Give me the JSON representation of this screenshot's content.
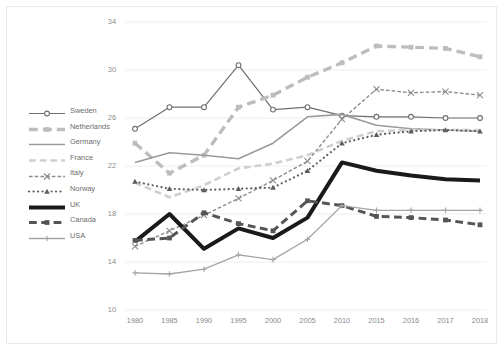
{
  "chart": {
    "type": "line",
    "title": "",
    "xlabel": "",
    "ylabel": "",
    "grid": true,
    "legend_position": "left-inside",
    "ylim": [
      10,
      34
    ],
    "ytick_step": 4,
    "yticks": [
      "10",
      "14",
      "18",
      "22",
      "26",
      "30",
      "34"
    ],
    "categories": [
      "1980",
      "1985",
      "1990",
      "1995",
      "2000",
      "2005",
      "2010",
      "2015",
      "2016",
      "2017",
      "2018"
    ]
  },
  "chart_data": {
    "type": "line",
    "title": "",
    "xlabel": "",
    "ylabel": "",
    "grid": true,
    "ylim": [
      10,
      34
    ],
    "yticks": [
      10,
      14,
      18,
      22,
      26,
      30,
      34
    ],
    "legend_position": "left-inside",
    "categories": [
      "1980",
      "1985",
      "1990",
      "1995",
      "2000",
      "2005",
      "2010",
      "2015",
      "2016",
      "2017",
      "2018"
    ],
    "series": [
      {
        "name": "Sweden",
        "color": "#6f6f6f",
        "style": "solid",
        "marker": "circle",
        "width": 1.2,
        "values": [
          25.1,
          26.9,
          26.9,
          30.4,
          26.7,
          26.9,
          26.2,
          26.1,
          26.1,
          26.0,
          26.0
        ]
      },
      {
        "name": "Netherlands",
        "color": "#bdbdbd",
        "style": "dashed",
        "marker": "square",
        "width": 3.4,
        "values": [
          23.9,
          21.4,
          22.9,
          26.9,
          27.9,
          29.4,
          30.6,
          32.0,
          31.9,
          31.8,
          31.1
        ]
      },
      {
        "name": "Germany",
        "color": "#9a9a9a",
        "style": "solid",
        "marker": "none",
        "width": 1.6,
        "values": [
          22.3,
          23.1,
          22.9,
          22.6,
          23.9,
          26.1,
          26.3,
          25.4,
          25.1,
          25.0,
          24.9
        ]
      },
      {
        "name": "France",
        "color": "#cfcfcf",
        "style": "dashed",
        "marker": "none",
        "width": 2.6,
        "values": [
          20.6,
          19.4,
          20.4,
          21.8,
          22.2,
          22.9,
          24.1,
          24.9,
          25.0,
          25.0,
          25.0
        ]
      },
      {
        "name": "Italy",
        "color": "#8d8d8d",
        "style": "dashed",
        "marker": "x",
        "width": 1.4,
        "values": [
          15.3,
          16.6,
          17.9,
          19.3,
          20.8,
          22.4,
          25.9,
          28.4,
          28.1,
          28.2,
          27.9
        ]
      },
      {
        "name": "Norway",
        "color": "#5e5e5e",
        "style": "dotted",
        "marker": "triangle",
        "width": 2.2,
        "values": [
          20.7,
          20.1,
          20.0,
          20.1,
          20.2,
          21.6,
          23.9,
          24.6,
          24.9,
          25.0,
          24.9
        ]
      },
      {
        "name": "UK",
        "color": "#1a1a1a",
        "style": "solid",
        "marker": "none",
        "width": 4.0,
        "values": [
          15.7,
          18.0,
          15.1,
          16.8,
          16.0,
          17.7,
          22.3,
          21.6,
          21.2,
          20.9,
          20.8
        ]
      },
      {
        "name": "Canada",
        "color": "#555555",
        "style": "dashed",
        "marker": "square",
        "width": 3.0,
        "values": [
          15.8,
          16.0,
          18.1,
          17.2,
          16.6,
          19.1,
          18.7,
          17.8,
          17.7,
          17.5,
          17.1
        ]
      },
      {
        "name": "USA",
        "color": "#a4a4a4",
        "style": "solid",
        "marker": "plus",
        "width": 1.3,
        "values": [
          13.1,
          13.0,
          13.4,
          14.6,
          14.2,
          15.9,
          18.7,
          18.3,
          18.3,
          18.3,
          18.3
        ]
      }
    ]
  }
}
